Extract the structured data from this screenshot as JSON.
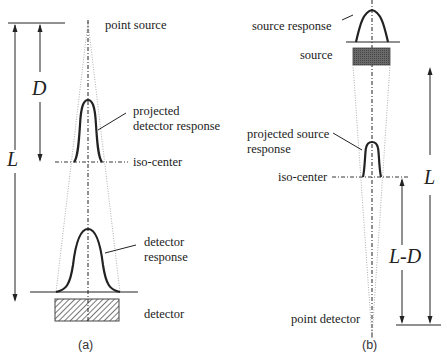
{
  "panel_a": {
    "caption": "(a)",
    "labels": {
      "point_source": "point source",
      "projected_line1": "projected",
      "projected_line2": "detector response",
      "iso_center": "iso-center",
      "detector_response_line1": "detector",
      "detector_response_line2": "response",
      "detector": "detector"
    },
    "symbols": {
      "D": "D",
      "L": "L"
    }
  },
  "panel_b": {
    "caption": "(b)",
    "labels": {
      "source_response": "source response",
      "source": "source",
      "projected_line1": "projected source",
      "projected_line2": "response",
      "iso_center": "iso-center",
      "point_detector": "point detector"
    },
    "symbols": {
      "L": "L",
      "L_minus_D": "L-D"
    }
  },
  "colors": {
    "line": "#222222",
    "detector_hatch": "#555555",
    "source_fill": "#555555",
    "beam": "#999999"
  }
}
